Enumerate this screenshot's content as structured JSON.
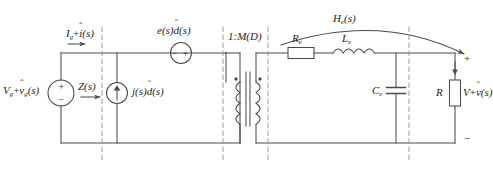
{
  "figure": {
    "kind": "small-signal-ac-equivalent-circuit",
    "title": "",
    "stroke_color": "#4a4a4a",
    "text_color": "#1c1c1c",
    "background": "#ffffff",
    "dashed_color": "#9a9a9a"
  },
  "labels": {
    "input_source": {
      "base1": "V",
      "sub1": "g",
      "plus": "+",
      "hat_var": "v",
      "sub2": "g",
      "tail": "(s)"
    },
    "input_current": {
      "base1": "I",
      "sub1": "g",
      "plus": "+",
      "hat_var": "i",
      "tail": "(s)"
    },
    "input_impedance": "Z(s)",
    "current_source": {
      "head": "j(s)",
      "hat_var": "d",
      "tail": "(s)"
    },
    "voltage_source": {
      "head": "e(s)",
      "hat_var": "d",
      "tail": "(s)"
    },
    "transformer_ratio": "1:M(D)",
    "transfer_function": {
      "base": "H",
      "sub": "e",
      "tail": "(s)"
    },
    "resistor_re": {
      "base": "R",
      "sub": "e"
    },
    "inductor_le": {
      "base": "L",
      "sub": "e"
    },
    "capacitor_ce": {
      "base": "C",
      "sub": "e"
    },
    "load_resistor": "R",
    "output_voltage": {
      "base1": "V",
      "plus": "+",
      "hat_var": "v",
      "tail": "(s)"
    },
    "terminal_plus": "+",
    "terminal_minus": "−",
    "vsource_plus": "+",
    "vsource_minus": "−",
    "esource_minus": "−",
    "esource_plus": "+",
    "hat_glyph": "ˆ"
  },
  "components": [
    {
      "name": "independent-voltage-source",
      "type": "voltage-source",
      "label": "Vg+v̂g(s)"
    },
    {
      "name": "input-impedance-annotation",
      "type": "annotation",
      "label": "Z(s)"
    },
    {
      "name": "duty-cycle-current-source",
      "type": "current-source",
      "label": "j(s)d̂(s)"
    },
    {
      "name": "duty-cycle-voltage-source",
      "type": "voltage-source",
      "label": "e(s)d̂(s)"
    },
    {
      "name": "ideal-transformer",
      "type": "transformer",
      "label": "1:M(D)"
    },
    {
      "name": "effective-resistor",
      "type": "resistor",
      "label": "Re"
    },
    {
      "name": "effective-inductor",
      "type": "inductor",
      "label": "Le"
    },
    {
      "name": "effective-capacitor",
      "type": "capacitor",
      "label": "Ce"
    },
    {
      "name": "load-resistor",
      "type": "resistor",
      "label": "R"
    },
    {
      "name": "control-to-output-transfer",
      "type": "annotation",
      "label": "He(s)"
    }
  ]
}
